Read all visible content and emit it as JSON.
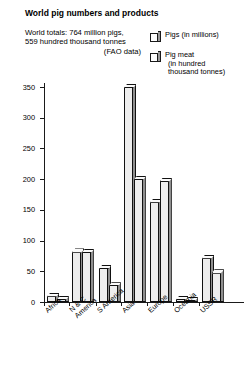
{
  "title": "World pig numbers and products",
  "subtitle": {
    "line1": "World totals: 764 million pigs,",
    "line2": "559 hundred thousand tonnes",
    "line3": "(FAO data)"
  },
  "legend": [
    {
      "label": "Pigs (in millions)",
      "swatch": "bar-swatch-pigs"
    },
    {
      "label": "Pig meat\n(in hundred\nthousand tonnes)",
      "swatch": "bar-swatch-pigmeat"
    }
  ],
  "colors": {
    "bar_front": "#ededed",
    "bar_side": "#8f8f8f",
    "bar_top": "#fbfbfb",
    "outline": "#111111",
    "axis": "#1a1a1a",
    "background": "#ffffff"
  },
  "chart_data": {
    "type": "bar",
    "title": "World pig numbers and products",
    "xlabel": "",
    "ylabel": "",
    "ylim": [
      0,
      350
    ],
    "yticks": [
      0,
      50,
      100,
      150,
      200,
      250,
      300,
      350
    ],
    "grid": false,
    "legend_position": "top-right",
    "categories": [
      "Africa",
      "N & C\nAmerica",
      "S America",
      "Asia",
      "Europe",
      "Oceania",
      "USSR"
    ],
    "series": [
      {
        "name": "Pigs (in millions)",
        "values": [
          10,
          82,
          55,
          350,
          163,
          5,
          72
        ]
      },
      {
        "name": "Pig meat (in hundred thousand tonnes)",
        "values": [
          5,
          81,
          27,
          200,
          197,
          3,
          48
        ]
      }
    ]
  }
}
